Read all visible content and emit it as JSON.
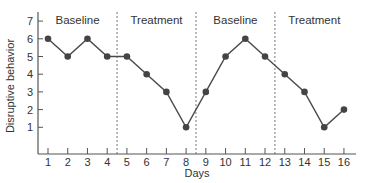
{
  "chart_data": {
    "type": "line",
    "title": "",
    "xlabel": "Days",
    "ylabel": "Disruptive behavior",
    "x": [
      1,
      2,
      3,
      4,
      5,
      6,
      7,
      8,
      9,
      10,
      11,
      12,
      13,
      14,
      15,
      16
    ],
    "series": [
      {
        "name": "Disruptive behavior",
        "values": [
          6,
          5,
          6,
          5,
          5,
          4,
          3,
          1,
          3,
          5,
          6,
          5,
          4,
          3,
          1,
          2
        ]
      }
    ],
    "y_ticks": [
      1,
      2,
      3,
      4,
      5,
      6,
      7
    ],
    "x_ticks": [
      1,
      2,
      3,
      4,
      5,
      6,
      7,
      8,
      9,
      10,
      11,
      12,
      13,
      14,
      15,
      16
    ],
    "ylim": [
      0,
      7.5
    ],
    "xlim": [
      0.5,
      16.5
    ],
    "grid": false,
    "phase_boundaries": [
      4.5,
      8.5,
      12.5
    ],
    "phases": [
      {
        "label": "Baseline",
        "start": 1,
        "end": 4
      },
      {
        "label": "Treatment",
        "start": 5,
        "end": 8
      },
      {
        "label": "Baseline",
        "start": 9,
        "end": 12
      },
      {
        "label": "Treatment",
        "start": 13,
        "end": 16
      }
    ],
    "colors": {
      "line": "#4a4a4a",
      "marker": "#444444",
      "axis": "#555555",
      "divider": "#777777"
    }
  }
}
